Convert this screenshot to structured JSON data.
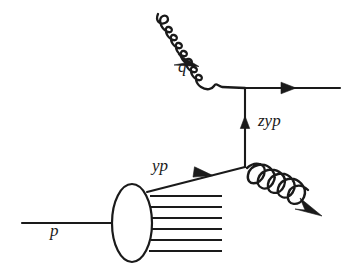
{
  "figure": {
    "kind": "feynman-diagram",
    "background_color": "#ffffff",
    "line_color": "#1a1a1a"
  },
  "labels": {
    "photon": "q",
    "exchanged_parton": "zyp",
    "struck_parton": "yp",
    "proton": "p"
  },
  "particles": [
    {
      "name": "incoming-proton",
      "label": "p",
      "style": "solid-line",
      "direction": "left-to-right",
      "has_arrow": false
    },
    {
      "name": "proton-blob",
      "label": "",
      "style": "ellipse",
      "direction": "none",
      "has_arrow": false
    },
    {
      "name": "proton-remnant",
      "label": "",
      "style": "multi-line",
      "direction": "left-to-right",
      "has_arrow": false,
      "line_count": 6
    },
    {
      "name": "struck-parton",
      "label": "yp",
      "style": "solid-line",
      "direction": "up-right",
      "has_arrow": true
    },
    {
      "name": "exchanged-parton",
      "label": "zyp",
      "style": "solid-line",
      "direction": "upward",
      "has_arrow": true
    },
    {
      "name": "radiated-gluon",
      "label": "",
      "style": "coil",
      "direction": "down-right",
      "has_arrow": true
    },
    {
      "name": "incoming-photon",
      "label": "q",
      "style": "wavy-line",
      "direction": "down-right",
      "has_arrow": true
    },
    {
      "name": "outgoing-quark",
      "label": "",
      "style": "solid-line",
      "direction": "left-to-right",
      "has_arrow": true
    }
  ],
  "vertices": [
    {
      "name": "photon-quark-vertex",
      "x": 245,
      "y": 88
    },
    {
      "name": "gluon-emission-vertex",
      "x": 245,
      "y": 167
    }
  ]
}
